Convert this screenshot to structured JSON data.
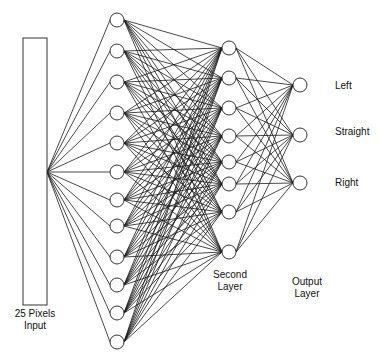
{
  "diagram": {
    "input": {
      "label_line1": "25 Pixels",
      "label_line2": "Input"
    },
    "hidden_layer_1": {
      "node_count": 12,
      "label": ""
    },
    "hidden_layer_2": {
      "node_count": 8,
      "label_line1": "Second",
      "label_line2": "Layer"
    },
    "output_layer": {
      "node_count": 3,
      "label_line1": "Output",
      "label_line2": "Layer",
      "outputs": [
        "Left",
        "Straight",
        "Right"
      ]
    },
    "connectivity": "fully-connected",
    "colors": {
      "line": "#1a1a1a",
      "node_stroke": "#333333",
      "background": "#ffffff"
    }
  }
}
